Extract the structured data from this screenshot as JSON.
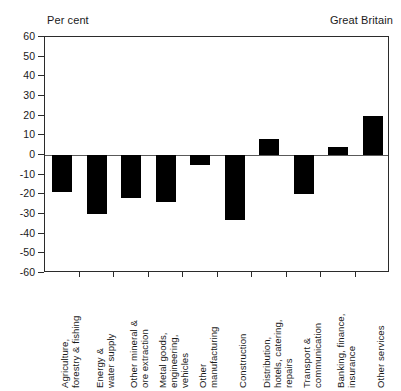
{
  "header": {
    "unit_label": "Per cent",
    "region_label": "Great Britain"
  },
  "chart_data": {
    "type": "bar",
    "title": "",
    "subtitle": "",
    "xlabel": "",
    "ylabel": "Per cent",
    "annotations": [
      "Per cent",
      "Great Britain"
    ],
    "ylim": [
      -60,
      60
    ],
    "ytick_step": 10,
    "yticks": [
      60,
      50,
      40,
      30,
      20,
      10,
      0,
      -10,
      -20,
      -30,
      -40,
      -50,
      -60
    ],
    "ytick_labels": [
      "60",
      "50",
      "40",
      "30",
      "20",
      "10",
      "0",
      "-10",
      "-20",
      "-30",
      "-40",
      "-50",
      "-60"
    ],
    "grid": false,
    "legend": false,
    "bar_color": "#000000",
    "categories": [
      "Agriculture, forestry & fishing",
      "Energy & water supply",
      "Other mineral & ore extraction",
      "Metal goods, engineering, vehicles",
      "Other manufacturing",
      "Construction",
      "Distribution, hotels, catering, repairs",
      "Transport & communication",
      "Banking, finance, insurance",
      "Other services"
    ],
    "category_lines": [
      [
        "Agriculture,",
        "forestry & fishing"
      ],
      [
        "Energy &",
        "water supply"
      ],
      [
        "Other mineral &",
        "ore extraction"
      ],
      [
        "Metal goods,",
        "engineering,",
        "vehicles"
      ],
      [
        "Other",
        "manufacturing"
      ],
      [
        "Construction"
      ],
      [
        "Distribution,",
        "hotels, catering,",
        "repairs"
      ],
      [
        "Transport &",
        "communication"
      ],
      [
        "Banking, finance,",
        "insurance"
      ],
      [
        "Other services"
      ]
    ],
    "values": [
      -19,
      -30,
      -22,
      -24,
      -5,
      -33,
      8,
      -20,
      4,
      20
    ]
  }
}
